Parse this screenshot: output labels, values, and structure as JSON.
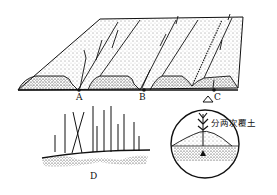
{
  "diagram": {
    "type": "agricultural-illustration",
    "labels": {
      "A": "A",
      "B": "B",
      "C": "C",
      "D": "D"
    },
    "annotation": "分两次覆土",
    "parts": [
      {
        "id": "A",
        "description": "planting furrow (first trench)"
      },
      {
        "id": "B",
        "description": "planting furrow (second trench)"
      },
      {
        "id": "C",
        "description": "furrow shown in magnified circular inset"
      },
      {
        "id": "D",
        "description": "cutting/seedling with rooted stems lying in row"
      }
    ],
    "colors": {
      "ink": "#111111",
      "background": "#ffffff"
    }
  }
}
